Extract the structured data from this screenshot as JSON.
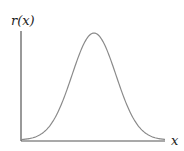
{
  "chart_data": {
    "type": "line",
    "title": "",
    "xlabel": "x",
    "ylabel": "r(x)",
    "grid": false,
    "legend": null,
    "series": [
      {
        "name": "r(x)",
        "shape": "bell curve (gaussian)",
        "peak_x_fraction": 0.5,
        "peak_y_fraction": 0.97
      }
    ],
    "colors": {
      "curve": "#8a8a8a",
      "axes": "#555555",
      "labels": "#222222"
    }
  }
}
